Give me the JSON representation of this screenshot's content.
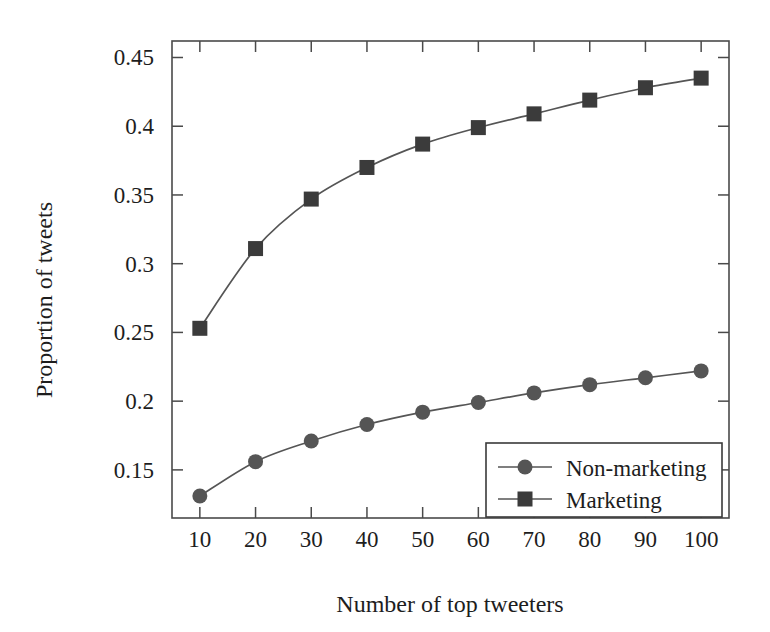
{
  "chart_data": {
    "type": "line",
    "title": "",
    "xlabel": "Number of top tweeters",
    "ylabel": "Proportion of tweets",
    "x": [
      10,
      20,
      30,
      40,
      50,
      60,
      70,
      80,
      90,
      100
    ],
    "xticklabels": [
      "10",
      "20",
      "30",
      "40",
      "50",
      "60",
      "70",
      "80",
      "90",
      "100"
    ],
    "yticks": [
      0.15,
      0.2,
      0.25,
      0.3,
      0.35,
      0.4,
      0.45
    ],
    "yticklabels": [
      "0.15",
      "0.2",
      "0.25",
      "0.3",
      "0.35",
      "0.4",
      "0.45"
    ],
    "xlim": [
      5,
      105
    ],
    "ylim": [
      0.115,
      0.462
    ],
    "grid": false,
    "legend_position": "lower right",
    "series": [
      {
        "name": "Non-marketing",
        "marker": "circle",
        "color": "#555555",
        "values": [
          0.131,
          0.156,
          0.171,
          0.183,
          0.192,
          0.199,
          0.206,
          0.212,
          0.217,
          0.222
        ]
      },
      {
        "name": "Marketing",
        "marker": "square",
        "color": "#3b3b3b",
        "values": [
          0.253,
          0.311,
          0.347,
          0.37,
          0.387,
          0.399,
          0.409,
          0.419,
          0.428,
          0.435
        ]
      }
    ]
  },
  "legend": {
    "entries": [
      {
        "label": "Non-marketing"
      },
      {
        "label": "Marketing"
      }
    ]
  }
}
